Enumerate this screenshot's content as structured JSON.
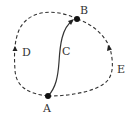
{
  "diagram": {
    "nodes": [
      {
        "id": "A",
        "label": "A",
        "x": 48,
        "y": 96
      },
      {
        "id": "B",
        "label": "B",
        "x": 77,
        "y": 19
      }
    ],
    "edges": [
      {
        "id": "C",
        "label": "C",
        "from": "A",
        "to": "B",
        "style": "solid"
      },
      {
        "id": "D",
        "label": "D",
        "from": "A",
        "to": "B",
        "style": "dashed",
        "side": "left"
      },
      {
        "id": "E",
        "label": "E",
        "from": "A",
        "to": "B",
        "style": "dashed",
        "side": "right"
      }
    ],
    "colors": {
      "line": "#333333",
      "node": "#111111",
      "background": "#ffffff"
    }
  }
}
